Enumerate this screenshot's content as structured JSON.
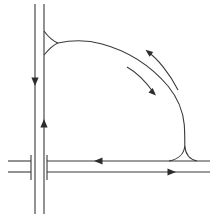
{
  "canvas": {
    "width": 220,
    "height": 224,
    "background": "#ffffff",
    "stroke_color": "#3a3a3a",
    "fill_color": "#2d2d2d",
    "stroke_width": 1.1
  },
  "diagram": {
    "type": "phase-portrait",
    "elements": [
      {
        "name": "vertical-line-left",
        "kind": "path",
        "d": "M 35 4 L 35 214"
      },
      {
        "name": "vertical-line-right",
        "kind": "path",
        "d": "M 44 4 L 44 214"
      },
      {
        "name": "horizontal-line-upper-left",
        "kind": "path",
        "d": "M 8 161 L 31 161"
      },
      {
        "name": "horizontal-line-lower-left",
        "kind": "path",
        "d": "M 8 172 L 31 172"
      },
      {
        "name": "horizontal-line-upper-right",
        "kind": "path",
        "d": "M 47 161 L 210 161"
      },
      {
        "name": "horizontal-line-lower-right",
        "kind": "path",
        "d": "M 47 172 L 210 172"
      },
      {
        "name": "end-cap-bar-left",
        "kind": "path",
        "d": "M 31 155 L 31 180"
      },
      {
        "name": "end-cap-bar-right",
        "kind": "path",
        "d": "M 47 155 L 47 180"
      },
      {
        "name": "upper-cusp-branch-top",
        "kind": "path",
        "d": "M 44 31 C 49 38 53 41 58 43"
      },
      {
        "name": "upper-cusp-branch-bottom",
        "kind": "path",
        "d": "M 44 55 C 49 49 53 45 58 43"
      },
      {
        "name": "main-loop-curve",
        "kind": "path",
        "d": "M 58 43 C 72 40 88 40 102 44 C 126 50.5 150 65 168 86 C 177 97 183 110 184.3 125 C 184.8 133 184.8 139 184.8 146"
      },
      {
        "name": "lower-cusp-branch-left",
        "kind": "path",
        "d": "M 184.8 146 C 184 154 178 159.5 169 161"
      },
      {
        "name": "lower-cusp-branch-right",
        "kind": "path",
        "d": "M 184.8 146 C 185.4 154 190 159.5 197 161"
      },
      {
        "name": "direction-arc-outer",
        "kind": "path",
        "d": "M 147.5 51.5 C 158 59 170 74 178 90"
      },
      {
        "name": "direction-arc-inner",
        "kind": "path",
        "d": "M 127 67 C 136 72 146 82 154 93"
      },
      {
        "name": "arrowhead-down-on-left-vertical-line",
        "kind": "polygon",
        "points": "35,86 31.4,77.5 38.6,77.5"
      },
      {
        "name": "arrowhead-up-on-right-vertical-line",
        "kind": "polygon",
        "points": "44,119 40.4,127.5 47.6,127.5"
      },
      {
        "name": "arrowhead-left-on-upper-horizontal-line",
        "kind": "polygon",
        "points": "94,161 102.5,157.4 102.5,164.6"
      },
      {
        "name": "arrowhead-right-on-lower-horizontal-line",
        "kind": "polygon",
        "points": "176,172 167.5,168.4 167.5,175.6"
      },
      {
        "name": "arrowhead-up-left-on-outer-arc",
        "kind": "polygon",
        "points": "145.5,49.8 153.2,52.0 149.6,56.8"
      },
      {
        "name": "arrowhead-down-right-on-inner-arc",
        "kind": "polygon",
        "points": "156,95.5 152.7,88.1 148.5,92.4"
      }
    ]
  }
}
